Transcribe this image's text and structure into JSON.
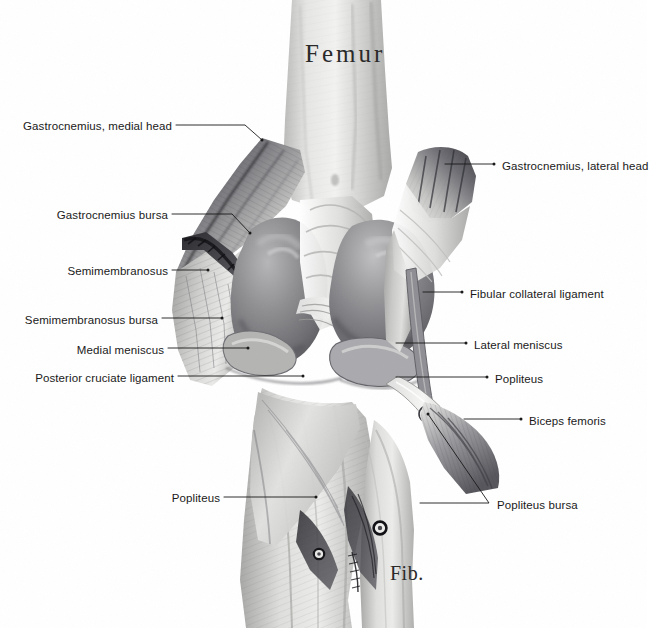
{
  "figure": {
    "background_color": "#ffffff",
    "ink_color": "#1a1a1a",
    "width": 647,
    "height": 628
  },
  "bone_captions": [
    {
      "id": "femur",
      "text": "Femur",
      "x": 305,
      "y": 40
    },
    {
      "id": "fib",
      "text": "Fib.",
      "x": 390,
      "y": 562
    }
  ],
  "labels_left": [
    {
      "id": "gastrocnemius-medial-head",
      "text": "Gastrocnemius, medial head",
      "text_x": 22,
      "text_y": 120,
      "line": [
        [
          176,
          125
        ],
        [
          245,
          125
        ],
        [
          262,
          140
        ]
      ]
    },
    {
      "id": "gastrocnemius-bursa",
      "text": "Gastrocnemius bursa",
      "text_x": 58,
      "text_y": 209,
      "line": [
        [
          172,
          214
        ],
        [
          232,
          214
        ],
        [
          250,
          233
        ]
      ]
    },
    {
      "id": "semimembranosus",
      "text": "Semimembranosus",
      "text_x": 56,
      "text_y": 265,
      "line": [
        [
          172,
          270
        ],
        [
          208,
          270
        ]
      ]
    },
    {
      "id": "semimembranosus-bursa",
      "text": "Semimembranosus bursa",
      "text_x": 30,
      "text_y": 314,
      "line": [
        [
          162,
          318
        ],
        [
          222,
          318
        ]
      ]
    },
    {
      "id": "medial-meniscus",
      "text": "Medial meniscus",
      "text_x": 80,
      "text_y": 344,
      "line": [
        [
          168,
          348
        ],
        [
          248,
          348
        ]
      ]
    },
    {
      "id": "posterior-cruciate-ligament",
      "text": "Posterior cruciate ligament",
      "text_x": 42,
      "text_y": 372,
      "line": [
        [
          178,
          376
        ],
        [
          303,
          376
        ]
      ]
    },
    {
      "id": "popliteus-left",
      "text": "Popliteus",
      "text_x": 172,
      "text_y": 492,
      "line": [
        [
          224,
          497
        ],
        [
          316,
          497
        ]
      ]
    }
  ],
  "labels_right": [
    {
      "id": "gastrocnemius-lateral-head",
      "text": "Gastrocnemius, lateral head",
      "text_x": 502,
      "text_y": 160,
      "line": [
        [
          445,
          164
        ],
        [
          494,
          164
        ]
      ]
    },
    {
      "id": "fibular-collateral-ligament",
      "text": "Fibular collateral ligament",
      "text_x": 470,
      "text_y": 288,
      "line": [
        [
          423,
          292
        ],
        [
          462,
          292
        ]
      ]
    },
    {
      "id": "lateral-meniscus",
      "text": "Lateral meniscus",
      "text_x": 474,
      "text_y": 339,
      "line": [
        [
          396,
          343
        ],
        [
          466,
          343
        ]
      ]
    },
    {
      "id": "popliteus-right",
      "text": "Popliteus",
      "text_x": 495,
      "text_y": 373,
      "line": [
        [
          396,
          377
        ],
        [
          487,
          377
        ]
      ]
    },
    {
      "id": "biceps-femoris",
      "text": "Biceps femoris",
      "text_x": 529,
      "text_y": 415,
      "line": [
        [
          464,
          419
        ],
        [
          521,
          419
        ]
      ]
    },
    {
      "id": "popliteus-bursa",
      "text": "Popliteus bursa",
      "text_x": 497,
      "text_y": 499,
      "line": [
        [
          420,
          503
        ],
        [
          489,
          503
        ],
        [
          428,
          414
        ]
      ]
    }
  ],
  "anatomy_regions": [
    {
      "id": "femur-shaft",
      "name": "Femur shaft",
      "tone": "#d8d8d6"
    },
    {
      "id": "medial-condyle",
      "name": "Medial femoral condyle",
      "tone": "#8e8e90"
    },
    {
      "id": "lateral-condyle",
      "name": "Lateral femoral condyle",
      "tone": "#8a8a8c"
    },
    {
      "id": "gastrocnemius-medial",
      "name": "Gastrocnemius medial head",
      "tone": "#6f6f72"
    },
    {
      "id": "gastrocnemius-lateral",
      "name": "Gastrocnemius lateral head",
      "tone": "#63636a"
    },
    {
      "id": "semimembranosus-muscle",
      "name": "Semimembranosus",
      "tone": "#b4b4b2"
    },
    {
      "id": "popliteus-muscle",
      "name": "Popliteus",
      "tone": "#c6c6c4"
    },
    {
      "id": "biceps-femoris-tendon",
      "name": "Biceps femoris tendon",
      "tone": "#9a9a9c"
    },
    {
      "id": "tibia-shaft",
      "name": "Tibia",
      "tone": "#cfcfcd"
    },
    {
      "id": "fibula-head",
      "name": "Fibula",
      "tone": "#c2c2c0"
    }
  ]
}
